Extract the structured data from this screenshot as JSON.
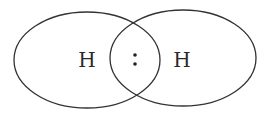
{
  "diagram": {
    "type": "lewis-structure-orbital-overlap",
    "atoms": [
      {
        "symbol": "H",
        "x": 87,
        "y": 60
      },
      {
        "symbol": "H",
        "x": 182,
        "y": 60
      }
    ],
    "shared_pair": {
      "symbol": ":",
      "x": 135,
      "y": 60
    },
    "orbitals": [
      {
        "cx": 87,
        "cy": 60,
        "rx": 73,
        "ry": 48
      },
      {
        "cx": 183,
        "cy": 58,
        "rx": 73,
        "ry": 48
      }
    ],
    "stroke_color": "#333333"
  }
}
